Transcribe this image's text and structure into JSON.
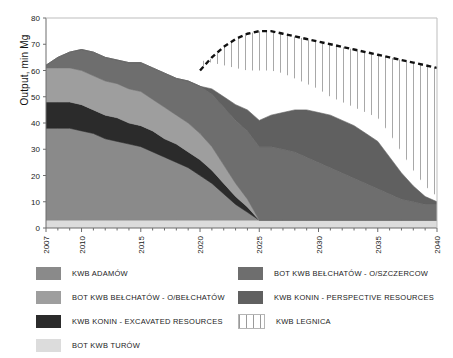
{
  "figure": {
    "ylabel": "Output, min Mg",
    "background": "#ffffff"
  },
  "legend": {
    "left_column": [
      {
        "label": "KWB ADAMÓW",
        "color": "#8a8a8a",
        "swatch": "solid"
      },
      {
        "label": "BOT KWB BEŁCHATÓW - O/BEŁCHATÓW",
        "color": "#9e9e9e",
        "swatch": "solid"
      },
      {
        "label": "KWB KONIN - EXCAVATED RESOURCES",
        "color": "#2b2b2b",
        "swatch": "solid"
      },
      {
        "label": "BOT KWB TURÓW",
        "color": "#dcdcdc",
        "swatch": "solid"
      }
    ],
    "right_column": [
      {
        "label": "BOT KWB BEŁCHATÓW - O/SZCZERCOW",
        "color": "#6e6e6e",
        "swatch": "solid"
      },
      {
        "label": "KWB KONIN - PERSPECTIVE RESOURCES",
        "color": "#606060",
        "swatch": "solid"
      },
      {
        "label": "KWB LEGNICA",
        "color": "#ffffff",
        "swatch": "hatched-vertical"
      }
    ]
  },
  "chart_data": {
    "type": "area",
    "title": "",
    "xlabel": "",
    "ylabel": "Output, min Mg",
    "xlim": [
      2007,
      2040
    ],
    "ylim": [
      0,
      80
    ],
    "ytick_step": 10,
    "yticks": [
      0,
      10,
      20,
      30,
      40,
      50,
      60,
      70,
      80
    ],
    "xticks": [
      2007,
      2010,
      2015,
      2020,
      2025,
      2030,
      2035,
      2040
    ],
    "xtick_minor_step": 1,
    "grid": false,
    "legend_position": "below",
    "stacked": true,
    "x": [
      2007,
      2008,
      2009,
      2010,
      2011,
      2012,
      2013,
      2014,
      2015,
      2016,
      2017,
      2018,
      2019,
      2020,
      2021,
      2022,
      2023,
      2024,
      2025,
      2026,
      2027,
      2028,
      2029,
      2030,
      2031,
      2032,
      2033,
      2034,
      2035,
      2036,
      2037,
      2038,
      2039,
      2040
    ],
    "series": [
      {
        "name": "BOT KWB TURÓW",
        "color": "#dcdcdc",
        "stack_order": 1,
        "values": [
          3,
          3,
          3,
          3,
          3,
          3,
          3,
          3,
          3,
          3,
          3,
          3,
          3,
          3,
          3,
          3,
          3,
          3,
          3,
          3,
          3,
          3,
          3,
          3,
          3,
          3,
          3,
          3,
          3,
          3,
          3,
          3,
          3,
          3
        ]
      },
      {
        "name": "KWB ADAMÓW",
        "color": "#8a8a8a",
        "stack_order": 2,
        "values": [
          35,
          35,
          35,
          34,
          33,
          31,
          30,
          29,
          28,
          26,
          24,
          22,
          20,
          17,
          14,
          10,
          6,
          3,
          0,
          0,
          0,
          0,
          0,
          0,
          0,
          0,
          0,
          0,
          0,
          0,
          0,
          0,
          0,
          0
        ]
      },
      {
        "name": "KWB KONIN - EXCAVATED RESOURCES",
        "color": "#2b2b2b",
        "stack_order": 3,
        "values": [
          10,
          10,
          10,
          10,
          9,
          9,
          9,
          8,
          8,
          8,
          7,
          7,
          6,
          6,
          5,
          4,
          3,
          2,
          0,
          0,
          0,
          0,
          0,
          0,
          0,
          0,
          0,
          0,
          0,
          0,
          0,
          0,
          0,
          0
        ]
      },
      {
        "name": "BOT KWB BEŁCHATÓW - O/BEŁCHATÓW",
        "color": "#9e9e9e",
        "stack_order": 4,
        "values": [
          13,
          13,
          13,
          13,
          13,
          13,
          13,
          13,
          13,
          12,
          12,
          11,
          11,
          10,
          9,
          7,
          5,
          3,
          0,
          0,
          0,
          0,
          0,
          0,
          0,
          0,
          0,
          0,
          0,
          0,
          0,
          0,
          0,
          0
        ]
      },
      {
        "name": "BOT KWB BEŁCHATÓW - O/SZCZERCOW",
        "color": "#6e6e6e",
        "stack_order": 5,
        "values": [
          1,
          4,
          6,
          8,
          9,
          9,
          9,
          10,
          11,
          12,
          13,
          14,
          16,
          18,
          20,
          22,
          24,
          26,
          28,
          28,
          27,
          26,
          24,
          22,
          20,
          18,
          16,
          14,
          12,
          10,
          8,
          7,
          6,
          6
        ]
      },
      {
        "name": "KWB KONIN - PERSPECTIVE RESOURCES",
        "color": "#606060",
        "stack_order": 6,
        "values": [
          0,
          0,
          0,
          0,
          0,
          0,
          0,
          0,
          0,
          0,
          0,
          0,
          0,
          0,
          2,
          4,
          6,
          8,
          10,
          12,
          14,
          16,
          18,
          19,
          20,
          20,
          20,
          19,
          18,
          14,
          10,
          6,
          3,
          1
        ]
      }
    ],
    "total_with_legnica": {
      "name": "KWB LEGNICA",
      "color": "#ffffff",
      "pattern": "vertical-hatch",
      "boundary_style": "dashed",
      "boundary_color": "#111111",
      "x": [
        2020,
        2021,
        2022,
        2023,
        2024,
        2025,
        2026,
        2027,
        2028,
        2029,
        2030,
        2031,
        2032,
        2033,
        2034,
        2035,
        2036,
        2037,
        2038,
        2039,
        2040
      ],
      "values": [
        60,
        65,
        69,
        72,
        74,
        75,
        75,
        74,
        73,
        72,
        71,
        70,
        69,
        68,
        67,
        66,
        65,
        64,
        63,
        62,
        61
      ]
    },
    "stack_top": [
      62,
      65,
      67,
      68,
      67,
      65,
      64,
      63,
      65,
      64,
      67,
      67,
      67,
      64,
      63,
      62,
      61,
      60,
      60,
      60,
      59,
      57,
      55,
      53,
      50,
      48,
      46,
      44,
      42,
      36,
      29,
      22,
      16,
      12
    ]
  }
}
